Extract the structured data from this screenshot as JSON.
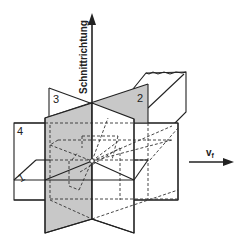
{
  "diagram": {
    "axis_vertical_label": "Schnittrichtung",
    "feed_label_main": "v",
    "feed_label_sub": "f",
    "plane_labels": [
      "1",
      "2",
      "3",
      "4"
    ],
    "colors": {
      "line": "#222222",
      "shade": "#c8c8c8",
      "background": "#ffffff"
    }
  }
}
